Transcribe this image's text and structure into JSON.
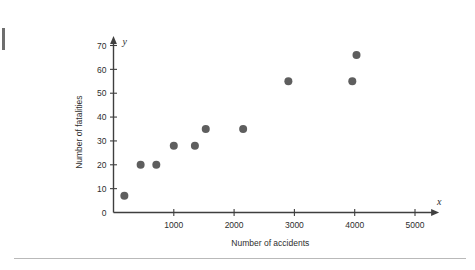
{
  "chart_data": {
    "type": "scatter",
    "title": "",
    "xlabel": "Number of accidents",
    "ylabel": "Number of fatalities",
    "x_axis_symbol": "x",
    "y_axis_symbol": "y",
    "xlim": [
      0,
      5400
    ],
    "ylim": [
      0,
      74
    ],
    "x_ticks": [
      0,
      1000,
      2000,
      3000,
      4000,
      5000
    ],
    "x_tick_labels": [
      "",
      "1000",
      "2000",
      "3000",
      "4000",
      "5000"
    ],
    "y_ticks": [
      0,
      10,
      20,
      30,
      40,
      50,
      60,
      70
    ],
    "y_tick_labels": [
      "0",
      "10",
      "20",
      "30",
      "40",
      "50",
      "60",
      "70"
    ],
    "grid": false,
    "legend": false,
    "marker_color": "#5e5e5e",
    "marker_size": 4,
    "axis_color": "#3f3f3f",
    "points": [
      {
        "x": 180,
        "y": 7
      },
      {
        "x": 450,
        "y": 20
      },
      {
        "x": 710,
        "y": 20
      },
      {
        "x": 1000,
        "y": 28
      },
      {
        "x": 1350,
        "y": 28
      },
      {
        "x": 1530,
        "y": 35
      },
      {
        "x": 2150,
        "y": 35
      },
      {
        "x": 2900,
        "y": 55
      },
      {
        "x": 3960,
        "y": 55
      },
      {
        "x": 4030,
        "y": 66
      }
    ]
  }
}
